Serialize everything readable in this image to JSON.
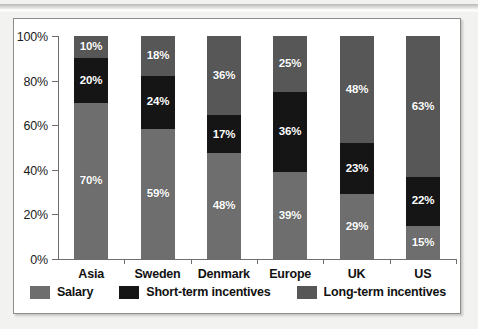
{
  "chart_data": {
    "type": "bar",
    "subtype": "stacked-100-percent",
    "title": "",
    "xlabel": "",
    "ylabel": "",
    "ylim": [
      0,
      100
    ],
    "ytick_labels": [
      "0%",
      "20%",
      "40%",
      "60%",
      "80%",
      "100%"
    ],
    "ytick_values": [
      0,
      20,
      40,
      60,
      80,
      100
    ],
    "grid": false,
    "legend_position": "bottom",
    "categories": [
      "Asia",
      "Sweden",
      "Denmark",
      "Europe",
      "UK",
      "US"
    ],
    "series": [
      {
        "name": "Salary",
        "color": "#6e6e6e",
        "values": [
          70,
          59,
          48,
          39,
          29,
          15
        ],
        "labels": [
          "70%",
          "59%",
          "48%",
          "39%",
          "29%",
          "15%"
        ]
      },
      {
        "name": "Short-term incentives",
        "color": "#151515",
        "values": [
          20,
          24,
          17,
          36,
          23,
          22
        ],
        "labels": [
          "20%",
          "24%",
          "17%",
          "36%",
          "23%",
          "22%"
        ]
      },
      {
        "name": "Long-term incentives",
        "color": "#575757",
        "values": [
          10,
          18,
          36,
          25,
          48,
          63
        ],
        "labels": [
          "10%",
          "18%",
          "36%",
          "25%",
          "48%",
          "63%"
        ]
      }
    ]
  },
  "colors": {
    "salary": "#6e6e6e",
    "short_term": "#151515",
    "long_term": "#575757",
    "axis": "#6d6d6b",
    "panel_border": "#8d8d8b",
    "page_background": "#f2f2f0",
    "panel_background": "#ffffff",
    "label_text": "#111111",
    "bar_label_text": "#ffffff"
  }
}
